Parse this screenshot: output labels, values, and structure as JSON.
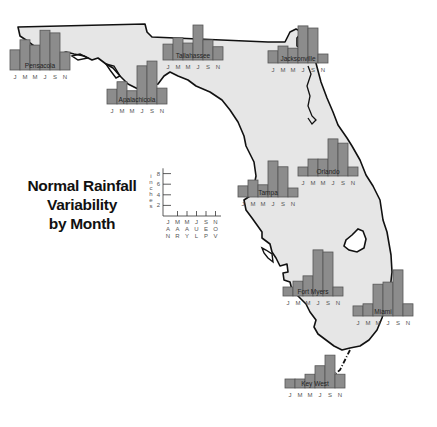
{
  "title": {
    "line1": "Normal Rainfall",
    "line2": "Variability",
    "line3": "by Month"
  },
  "colors": {
    "land": "#e6e6e6",
    "coastline": "#111111",
    "bar_fill": "#8c8c8c",
    "bar_stroke": "#555555",
    "water": "#ffffff"
  },
  "legend": {
    "axis_label": "inches",
    "y_ticks": [
      "2",
      "4",
      "6",
      "8"
    ],
    "month_ticks": [
      {
        "lines": [
          "J",
          "A",
          "N"
        ]
      },
      {
        "lines": [
          "M",
          "A",
          "R"
        ]
      },
      {
        "lines": [
          "M",
          "A",
          "Y"
        ]
      },
      {
        "lines": [
          "J",
          "U",
          "L"
        ]
      },
      {
        "lines": [
          "S",
          "E",
          "P"
        ]
      },
      {
        "lines": [
          "N",
          "O",
          "V"
        ]
      }
    ]
  },
  "chart_data": {
    "type": "bar",
    "title": "Normal Rainfall Variability by Month",
    "ylabel": "inches",
    "ylim": [
      0,
      9
    ],
    "y_ticks": [
      2,
      4,
      6,
      8
    ],
    "categories": [
      "J",
      "M",
      "M",
      "J",
      "S",
      "N"
    ],
    "category_full": [
      "January",
      "March",
      "May",
      "July",
      "September",
      "November"
    ],
    "series": [
      {
        "name": "Pensacola",
        "values": [
          3.8,
          5.7,
          4.7,
          7.5,
          7.0,
          3.4
        ]
      },
      {
        "name": "Tallahassee",
        "values": [
          3.0,
          4.2,
          3.2,
          6.6,
          3.8,
          2.5
        ]
      },
      {
        "name": "Jacksonville",
        "values": [
          2.3,
          3.2,
          2.8,
          7.0,
          6.6,
          1.3
        ]
      },
      {
        "name": "Apalachicola",
        "values": [
          2.8,
          4.2,
          2.5,
          7.2,
          8.1,
          3.0
        ]
      },
      {
        "name": "Orlando",
        "values": [
          1.7,
          3.2,
          3.2,
          7.0,
          6.2,
          1.3
        ]
      },
      {
        "name": "Tampa",
        "values": [
          2.1,
          3.2,
          2.3,
          6.8,
          5.7,
          1.5
        ]
      },
      {
        "name": "Fort Myers",
        "values": [
          1.5,
          2.8,
          3.8,
          8.7,
          8.3,
          1.5
        ]
      },
      {
        "name": "Miami",
        "values": [
          1.9,
          2.3,
          6.0,
          6.4,
          8.7,
          2.3
        ]
      },
      {
        "name": "Key West",
        "values": [
          1.3,
          1.7,
          2.6,
          4.2,
          6.2,
          2.6
        ]
      }
    ]
  }
}
